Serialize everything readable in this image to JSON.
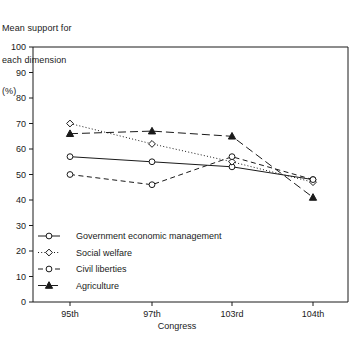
{
  "chart_data": {
    "type": "line",
    "title": "",
    "ylabel": "Mean support for\neach dimension\n(%)",
    "ylabel_lines": [
      "Mean support for",
      "each dimension",
      "(%)"
    ],
    "xlabel": "Congress",
    "categories": [
      "95th",
      "97th",
      "103rd",
      "104th"
    ],
    "x_tick_labels": [
      "95th",
      "97th",
      "103rd",
      "104th"
    ],
    "y_tick_labels": [
      "0",
      "10",
      "20",
      "30",
      "40",
      "50",
      "60",
      "70",
      "80",
      "90",
      "100"
    ],
    "y_ticks": [
      0,
      10,
      20,
      30,
      40,
      50,
      60,
      70,
      80,
      90,
      100
    ],
    "ylim": [
      0,
      100
    ],
    "grid": false,
    "legend_position": "inside-lower-left",
    "series": [
      {
        "name": "Government economic management",
        "values": [
          57,
          55,
          53,
          48
        ],
        "marker": "open-circle",
        "line_style": "solid",
        "color": "#1a1a1a"
      },
      {
        "name": "Social welfare",
        "values": [
          70,
          62,
          55,
          47
        ],
        "marker": "open-diamond",
        "line_style": "dotted",
        "color": "#1a1a1a"
      },
      {
        "name": "Civil liberties",
        "values": [
          50,
          46,
          57,
          48
        ],
        "marker": "open-circle",
        "line_style": "dashed",
        "color": "#1a1a1a"
      },
      {
        "name": "Agriculture",
        "values": [
          66,
          67,
          65,
          41
        ],
        "marker": "filled-triangle",
        "line_style": "dashed-long",
        "color": "#1a1a1a"
      }
    ]
  }
}
